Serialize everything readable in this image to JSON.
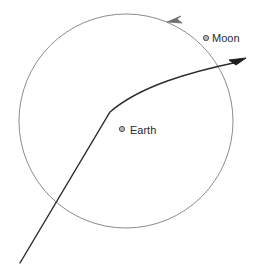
{
  "figure": {
    "type": "diagram",
    "background_color": "#ffffff",
    "width": 264,
    "height": 270
  },
  "labels": {
    "earth": "Earth",
    "moon": "Moon"
  },
  "colors": {
    "orbit_stroke": "#8c8c8c",
    "trajectory_stroke": "#2b2b2b",
    "body_marker_stroke": "#555555",
    "body_marker_fill": "#b8b8b8",
    "text": "#2b2b2b"
  },
  "geometry": {
    "moon_orbit": {
      "center_x": 126,
      "center_y": 121,
      "radius": 107,
      "stroke_width": 1,
      "direction": "counterclockwise"
    },
    "earth_marker": {
      "cx": 122,
      "cy": 129,
      "r": 2.6
    },
    "moon_marker": {
      "cx": 206,
      "cy": 38,
      "r": 2.6
    },
    "earth_label_pos": {
      "x": 130,
      "y": 134
    },
    "moon_label_pos": {
      "x": 212,
      "y": 42
    },
    "trajectory": {
      "start_x": 20,
      "start_y": 263,
      "bend_x": 110,
      "bend_y": 112,
      "end_x": 245,
      "end_y": 60,
      "stroke_width": 1.4
    },
    "orbit_direction_arrow": {
      "x": 171,
      "y": 22
    }
  }
}
